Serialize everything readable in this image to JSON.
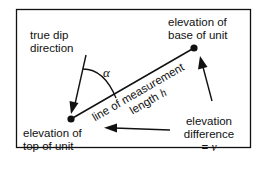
{
  "diagram": {
    "colors": {
      "stroke": "#111111",
      "background": "#ffffff"
    },
    "labels": {
      "true_dip_line1": "true dip",
      "true_dip_line2": "direction",
      "base_line1": "elevation of",
      "base_line2": "base of unit",
      "top_line1": "elevation of",
      "top_line2": "top of unit",
      "diff_line1": "elevation",
      "diff_line2": "difference",
      "diff_line3_prefix": "= ",
      "diff_line3_symbol": "v",
      "measure_line1": "line of measurement",
      "measure_line2_prefix": "length ",
      "measure_line2_symbol": "h",
      "angle_symbol": "α"
    },
    "points": {
      "top_of_unit": {
        "x": 71,
        "y": 119
      },
      "base_of_unit": {
        "x": 194,
        "y": 48
      }
    }
  }
}
